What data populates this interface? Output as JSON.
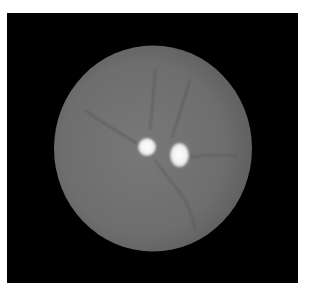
{
  "image": {
    "description": "Grayscale fundus-style image: gray circular disc on black square background with two bright white spots",
    "background_color": "#ffffff",
    "frame_color": "#000000",
    "disc_color": "#707070",
    "spot_color": "#f4f4f4",
    "vessel_color": "#4a4a4a"
  }
}
